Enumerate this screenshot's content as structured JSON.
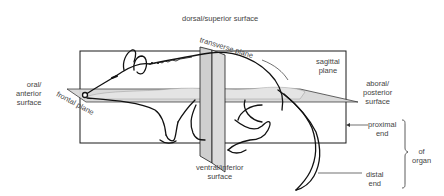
{
  "diagram": {
    "type": "anatomical-planes",
    "labels": {
      "dorsal": "dorsal/superior surface",
      "ventral_line1": "ventral/inferior",
      "ventral_line2": "surface",
      "oral_line1": "oral/",
      "oral_line2": "anterior",
      "oral_line3": "surface",
      "aboral_line1": "aboral/",
      "aboral_line2": "posterior",
      "aboral_line3": "surface",
      "sagittal_line1": "sagittal",
      "sagittal_line2": "plane",
      "transverse": "transverse plane",
      "frontal": "frontal plane",
      "proximal_line1": "proximal",
      "proximal_line2": "end",
      "distal_line1": "distal",
      "distal_line2": "end",
      "organ_line1": "of",
      "organ_line2": "organ"
    },
    "colors": {
      "line": "#1a1a1a",
      "plane_fill": "#d9d9d9",
      "plane_fill_dark": "#c4c4c4",
      "text": "#444444"
    }
  }
}
